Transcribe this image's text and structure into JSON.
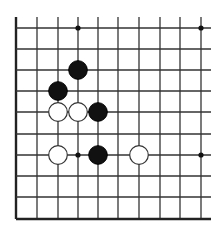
{
  "board": {
    "title": "",
    "colors": {
      "background": "#ffffff",
      "line": "#333333",
      "black_stone": "#111111",
      "white_stone": "#ffffff"
    },
    "visible_columns": 10,
    "visible_rows": 10,
    "edges_shown": [
      "left",
      "bottom"
    ],
    "star_points": [
      {
        "col": 3,
        "row": 0
      },
      {
        "col": 9,
        "row": 0
      },
      {
        "col": 3,
        "row": 6
      },
      {
        "col": 9,
        "row": 6
      }
    ],
    "stones": [
      {
        "color": "black",
        "col": 3,
        "row": 2
      },
      {
        "color": "black",
        "col": 2,
        "row": 3
      },
      {
        "color": "white",
        "col": 2,
        "row": 4
      },
      {
        "color": "white",
        "col": 3,
        "row": 4
      },
      {
        "color": "black",
        "col": 4,
        "row": 4
      },
      {
        "color": "white",
        "col": 2,
        "row": 6
      },
      {
        "color": "black",
        "col": 4,
        "row": 6
      },
      {
        "color": "white",
        "col": 6,
        "row": 6
      }
    ]
  }
}
